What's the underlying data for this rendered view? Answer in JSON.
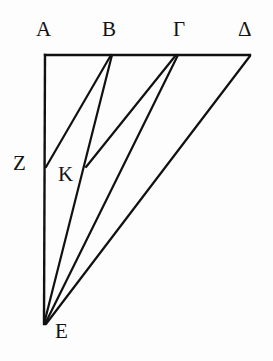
{
  "figure": {
    "type": "line-diagram",
    "background_color": "#fdfdfd",
    "stroke_color": "#111111",
    "label_color": "#121212",
    "width": 273,
    "height": 361,
    "points": {
      "A": {
        "label": "A",
        "x": 45,
        "y": 55,
        "label_x": 36,
        "label_y": 19
      },
      "B": {
        "label": "B",
        "x": 111,
        "y": 55,
        "label_x": 102,
        "label_y": 19
      },
      "G": {
        "label": "Γ",
        "x": 177,
        "y": 55,
        "label_x": 173,
        "label_y": 19
      },
      "D": {
        "label": "Δ",
        "x": 250,
        "y": 55,
        "label_x": 238,
        "label_y": 19
      },
      "Z": {
        "label": "Z",
        "x": 46,
        "y": 167,
        "label_x": 13,
        "label_y": 153
      },
      "K": {
        "label": "K",
        "x": 87,
        "y": 166,
        "label_x": 58,
        "label_y": 164
      },
      "E": {
        "label": "E",
        "x": 44,
        "y": 324,
        "label_x": 55,
        "label_y": 321
      }
    },
    "segments": [
      {
        "name": "segment-A-D",
        "from": "A",
        "to": "D",
        "description": "top horizontal edge through B and Gamma"
      },
      {
        "name": "segment-A-E",
        "from": "A",
        "to": "E",
        "description": "left vertical edge passing through Z"
      },
      {
        "name": "segment-B-Z",
        "from": "B",
        "to": "Z",
        "description": "cevian from B to Z on AE"
      },
      {
        "name": "segment-B-E",
        "from": "B",
        "to": "E",
        "description": "cevian from B to E through K"
      },
      {
        "name": "segment-G-K",
        "from": "G",
        "to": "K",
        "description": "cevian from Gamma to K"
      },
      {
        "name": "segment-G-E",
        "from": "G",
        "to": "E",
        "description": "cevian from Gamma to E"
      },
      {
        "name": "segment-D-E",
        "from": "D",
        "to": "E",
        "description": "hypotenuse from Delta to E"
      }
    ],
    "labels": [
      {
        "key": "A",
        "text": "A"
      },
      {
        "key": "B",
        "text": "B"
      },
      {
        "key": "G",
        "text": "Γ"
      },
      {
        "key": "D",
        "text": "Δ"
      },
      {
        "key": "Z",
        "text": "Z"
      },
      {
        "key": "K",
        "text": "K"
      },
      {
        "key": "E",
        "text": "E"
      }
    ]
  }
}
